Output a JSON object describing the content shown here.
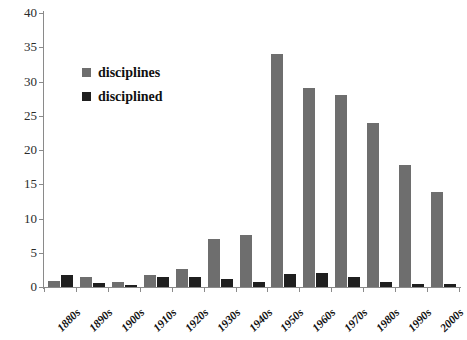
{
  "chart_data": {
    "type": "bar",
    "title": "",
    "xlabel": "",
    "ylabel": "",
    "ylim": [
      0,
      40
    ],
    "ytick_step": 5,
    "yticks": [
      0,
      5,
      10,
      15,
      20,
      25,
      30,
      35,
      40
    ],
    "grid": false,
    "legend_position": "upper-left-inside",
    "categories": [
      "1880s",
      "1890s",
      "1900s",
      "1910s",
      "1920s",
      "1930s",
      "1940s",
      "1950s",
      "1960s",
      "1970s",
      "1980s",
      "1990s",
      "2000s"
    ],
    "series": [
      {
        "name": "disciplines",
        "color": "#6e6e6e",
        "values": [
          0.9,
          1.4,
          0.8,
          1.7,
          2.7,
          7.0,
          7.6,
          34.0,
          29.0,
          28.0,
          24.0,
          17.8,
          13.8
        ]
      },
      {
        "name": "disciplined",
        "color": "#1f1f1f",
        "values": [
          1.7,
          0.6,
          0.3,
          1.4,
          1.5,
          1.2,
          0.8,
          1.9,
          2.0,
          1.4,
          0.7,
          0.5,
          0.4
        ]
      }
    ]
  },
  "axis": {
    "color": "#8a8a8a",
    "y_tick_labels": [
      "0",
      "5",
      "10",
      "15",
      "20",
      "25",
      "30",
      "35",
      "40"
    ]
  },
  "legend": {
    "items": [
      {
        "label": "disciplines",
        "color": "#6e6e6e"
      },
      {
        "label": "disciplined",
        "color": "#1f1f1f"
      }
    ]
  }
}
